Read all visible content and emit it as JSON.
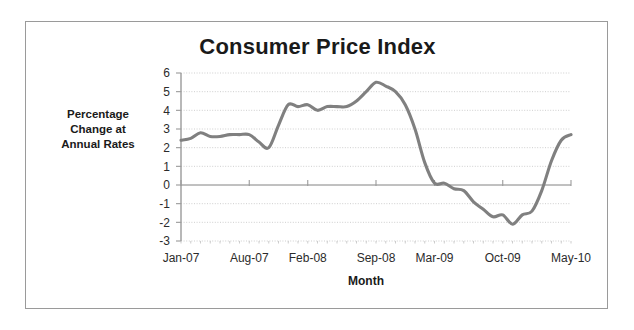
{
  "chart_data": {
    "type": "line",
    "title": "Consumer Price Index",
    "xlabel": "Month",
    "ylabel": "Percentage Change at Annual Rates",
    "ylabel_lines": [
      "Percentage",
      "Change at",
      "Annual Rates"
    ],
    "ylim": [
      -3,
      6
    ],
    "ytick_labels": [
      "6",
      "5",
      "4",
      "3",
      "2",
      "1",
      "0",
      "-1",
      "-2",
      "-3"
    ],
    "yticks": [
      6,
      5,
      4,
      3,
      2,
      1,
      0,
      -1,
      -2,
      -3
    ],
    "grid": true,
    "legend": "none",
    "line_color": "#808080",
    "xtick_labels": [
      "Jan-07",
      "Aug-07",
      "Feb-08",
      "Sep-08",
      "Mar-09",
      "Oct-09",
      "May-10"
    ],
    "xtick_indices": [
      0,
      7,
      13,
      20,
      26,
      33,
      40
    ],
    "x": [
      "Jan-07",
      "Feb-07",
      "Mar-07",
      "Apr-07",
      "May-07",
      "Jun-07",
      "Jul-07",
      "Aug-07",
      "Sep-07",
      "Oct-07",
      "Nov-07",
      "Dec-07",
      "Jan-08",
      "Feb-08",
      "Mar-08",
      "Apr-08",
      "May-08",
      "Jun-08",
      "Jul-08",
      "Aug-08",
      "Sep-08",
      "Oct-08",
      "Nov-08",
      "Dec-08",
      "Jan-09",
      "Feb-09",
      "Mar-09",
      "Apr-09",
      "May-09",
      "Jun-09",
      "Jul-09",
      "Aug-09",
      "Sep-09",
      "Oct-09",
      "Nov-09",
      "Dec-09",
      "Jan-10",
      "Feb-10",
      "Mar-10",
      "Apr-10",
      "May-10"
    ],
    "values": [
      2.4,
      2.5,
      2.8,
      2.6,
      2.6,
      2.7,
      2.7,
      2.7,
      2.3,
      2.0,
      3.2,
      4.3,
      4.2,
      4.3,
      4.0,
      4.2,
      4.2,
      4.2,
      4.5,
      5.0,
      5.5,
      5.3,
      5.0,
      4.3,
      3.0,
      1.2,
      0.1,
      0.1,
      -0.2,
      -0.3,
      -0.9,
      -1.3,
      -1.7,
      -1.6,
      -2.1,
      -1.6,
      -1.4,
      -0.3,
      1.3,
      2.4,
      2.7
    ]
  }
}
